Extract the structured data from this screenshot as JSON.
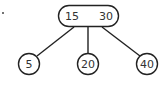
{
  "diagram": {
    "type": "b-tree",
    "stroke_color": "#222222",
    "text_color": "#333333",
    "root": {
      "keys": [
        "15",
        "30"
      ]
    },
    "children": [
      {
        "key": "5"
      },
      {
        "key": "20"
      },
      {
        "key": "40"
      }
    ]
  }
}
